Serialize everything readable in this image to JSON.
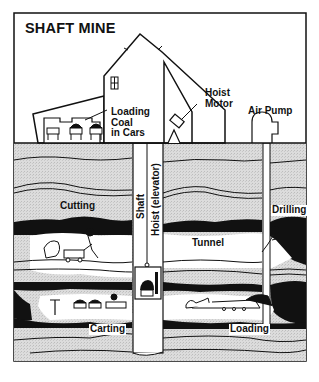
{
  "title": "SHAFT MINE",
  "labels": {
    "loading_coal": [
      "Loading",
      "Coal",
      "in Cars"
    ],
    "hoist_motor": [
      "Hoist",
      "Motor"
    ],
    "air_pump": "Air Pump",
    "cutting": "Cutting",
    "shaft": "Shaft",
    "hoist_elevator": "Hoist (elevator)",
    "drilling": "Drilling",
    "tunnel": "Tunnel",
    "carting": "Carting",
    "loading": "Loading"
  },
  "colors": {
    "ink": "#111111",
    "rock": "#d9d9d9",
    "coal": "#111111",
    "background": "#ffffff"
  }
}
